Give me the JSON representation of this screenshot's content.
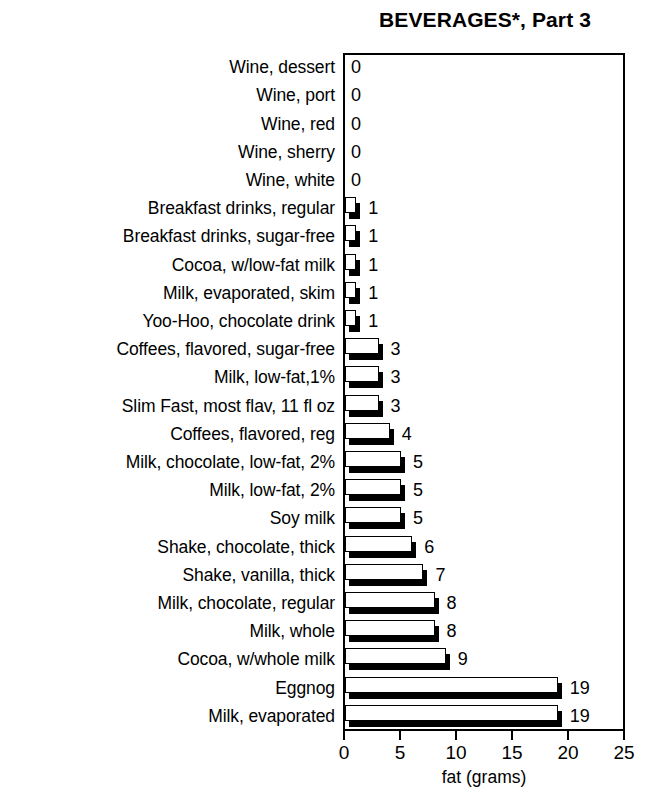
{
  "chart_data": {
    "type": "bar",
    "orientation": "horizontal",
    "title": "BEVERAGES*, Part 3",
    "xlabel": "fat (grams)",
    "ylabel": "",
    "xlim": [
      0,
      25
    ],
    "xticks": [
      0,
      5,
      10,
      15,
      20,
      25
    ],
    "grid": false,
    "legend": null,
    "categories": [
      "Wine, dessert",
      "Wine, port",
      "Wine, red",
      "Wine, sherry",
      "Wine, white",
      "Breakfast drinks, regular",
      "Breakfast drinks, sugar-free",
      "Cocoa, w/low-fat milk",
      "Milk, evaporated, skim",
      "Yoo-Hoo, chocolate drink",
      "Coffees, flavored, sugar-free",
      "Milk, low-fat,1%",
      "Slim Fast, most flav, 11 fl oz",
      "Coffees, flavored, reg",
      "Milk, chocolate, low-fat, 2%",
      "Milk, low-fat, 2%",
      "Soy milk",
      "Shake, chocolate, thick",
      "Shake, vanilla, thick",
      "Milk, chocolate, regular",
      "Milk, whole",
      "Cocoa, w/whole milk",
      "Eggnog",
      "Milk, evaporated"
    ],
    "values": [
      0,
      0,
      0,
      0,
      0,
      1,
      1,
      1,
      1,
      1,
      3,
      3,
      3,
      4,
      5,
      5,
      5,
      6,
      7,
      8,
      8,
      9,
      19,
      19
    ],
    "value_labels": [
      "0",
      "0",
      "0",
      "0",
      "0",
      "1",
      "1",
      "1",
      "1",
      "1",
      "3",
      "3",
      "3",
      "4",
      "5",
      "5",
      "5",
      "6",
      "7",
      "8",
      "8",
      "9",
      "19",
      "19"
    ],
    "xtick_labels": [
      "0",
      "5",
      "10",
      "15",
      "20",
      "25"
    ],
    "colors": {
      "bar_face": "#ffffff",
      "bar_outline": "#000000",
      "bar_shadow": "#000000",
      "axis": "#000000",
      "text": "#000000",
      "background": "#ffffff"
    }
  }
}
